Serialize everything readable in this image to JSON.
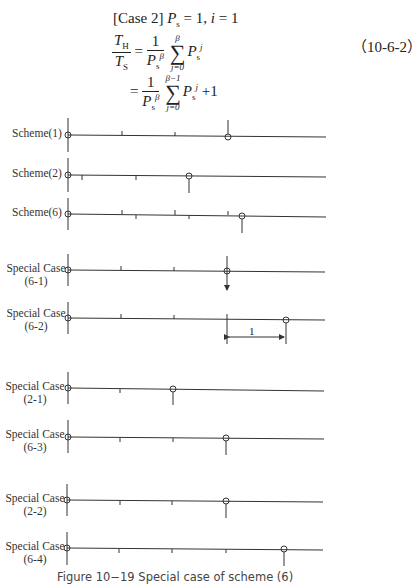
{
  "top_line_partial": "(cut-off text line above)",
  "equation": {
    "case_line": {
      "prefix": "[Case 2]",
      "P": "P",
      "P_sub": "s",
      "rest": " = 1, ",
      "i": "i",
      "eq": " = 1"
    },
    "lhs": {
      "num": "T",
      "num_sub": "H",
      "den": "T",
      "den_sub": "S"
    },
    "line1": {
      "eq": "=",
      "frac_num": "1",
      "frac_den": "P",
      "frac_den_sub": "s",
      "frac_den_sup": "β",
      "sum_top": "β",
      "sum_bottom": "j=0",
      "term": "P",
      "term_sub": "s",
      "term_sup": "j"
    },
    "line2": {
      "eq": "=",
      "frac_num": "1",
      "frac_den": "P",
      "frac_den_sub": "s",
      "frac_den_sup": "β",
      "sum_top": "β−1",
      "sum_bottom": "j=0",
      "term": "P",
      "term_sub": "s",
      "term_sup": "j",
      "tail": "+1"
    },
    "number": "（10-6-2）"
  },
  "diagram": {
    "rows": [
      {
        "label": [
          "Scheme(1)"
        ],
        "y": 135
      },
      {
        "label": [
          "Scheme(2)"
        ],
        "y": 175
      },
      {
        "label": [
          "Scheme(6)"
        ],
        "y": 214
      },
      {
        "label": [
          "Special Case",
          "(6-1)"
        ],
        "y": 270
      },
      {
        "label": [
          "Special Case",
          "(6-2)"
        ],
        "y": 318
      },
      {
        "label": [
          "Special Case",
          "(2-1)"
        ],
        "y": 388
      },
      {
        "label": [
          "Special Case",
          "(6-3)"
        ],
        "y": 437
      },
      {
        "label": [
          "Special Case",
          "(2-2)"
        ],
        "y": 500
      },
      {
        "label": [
          "Special Case",
          "(6-4)"
        ],
        "y": 548
      }
    ],
    "dimension_label": "1"
  },
  "caption": "Figure 10−19   Special case of scheme (6)"
}
